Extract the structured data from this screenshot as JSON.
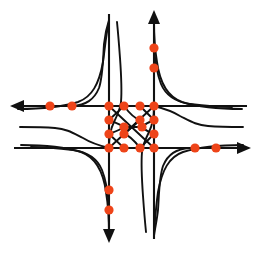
{
  "diagram": {
    "type": "node-link-road-network",
    "canvas": {
      "width": 261,
      "height": 253
    },
    "colors": {
      "background": "#ffffff",
      "road": "#111111",
      "node": "#ee4419",
      "arrow": "#111111"
    },
    "axes": {
      "horizontal_road_upper_y": 106,
      "horizontal_road_lower_y": 148,
      "vertical_road_left_x": 109,
      "vertical_road_right_x": 154
    },
    "arrows": [
      {
        "name": "west-arrow",
        "direction": "west",
        "tip_x": 10,
        "tip_y": 106
      },
      {
        "name": "east-arrow",
        "direction": "east",
        "tip_x": 251,
        "tip_y": 148
      },
      {
        "name": "north-arrow",
        "direction": "north",
        "tip_x": 154,
        "tip_y": 10
      },
      {
        "name": "south-arrow",
        "direction": "south",
        "tip_x": 109,
        "tip_y": 243
      }
    ],
    "nodes": [
      {
        "id": "n01",
        "label": "west-outer-far",
        "x": 50,
        "y": 106,
        "r": 4.6
      },
      {
        "id": "n02",
        "label": "west-outer-near",
        "x": 72,
        "y": 106,
        "r": 4.6
      },
      {
        "id": "n03",
        "label": "grid-r1c1",
        "x": 109,
        "y": 106,
        "r": 4.6
      },
      {
        "id": "n04",
        "label": "grid-r1c2",
        "x": 124,
        "y": 106,
        "r": 4.6
      },
      {
        "id": "n05",
        "label": "grid-r1c3",
        "x": 140,
        "y": 106,
        "r": 4.6
      },
      {
        "id": "n06",
        "label": "grid-r1c4",
        "x": 154,
        "y": 106,
        "r": 4.6
      },
      {
        "id": "n07",
        "label": "grid-r2c1",
        "x": 109,
        "y": 120,
        "r": 4.6
      },
      {
        "id": "n08",
        "label": "grid-r2c3",
        "x": 140,
        "y": 120,
        "r": 4.6
      },
      {
        "id": "n09",
        "label": "grid-r2c4",
        "x": 154,
        "y": 120,
        "r": 4.6
      },
      {
        "id": "n10",
        "label": "grid-mid-left",
        "x": 124,
        "y": 127,
        "r": 4.6
      },
      {
        "id": "n11",
        "label": "grid-mid-right",
        "x": 142,
        "y": 127,
        "r": 4.6
      },
      {
        "id": "n12",
        "label": "grid-r3c1",
        "x": 109,
        "y": 134,
        "r": 4.6
      },
      {
        "id": "n13",
        "label": "grid-r3c2",
        "x": 124,
        "y": 134,
        "r": 4.6
      },
      {
        "id": "n14",
        "label": "grid-r3c4",
        "x": 154,
        "y": 134,
        "r": 4.6
      },
      {
        "id": "n15",
        "label": "grid-r4c1",
        "x": 109,
        "y": 148,
        "r": 4.6
      },
      {
        "id": "n16",
        "label": "grid-r4c2",
        "x": 124,
        "y": 148,
        "r": 4.6
      },
      {
        "id": "n17",
        "label": "grid-r4c3",
        "x": 140,
        "y": 148,
        "r": 4.6
      },
      {
        "id": "n18",
        "label": "grid-r4c4",
        "x": 154,
        "y": 148,
        "r": 4.6
      },
      {
        "id": "n19",
        "label": "east-outer-near",
        "x": 195,
        "y": 148,
        "r": 4.6
      },
      {
        "id": "n20",
        "label": "east-outer-far",
        "x": 216,
        "y": 148,
        "r": 4.6
      },
      {
        "id": "n21",
        "label": "north-outer-near",
        "x": 154,
        "y": 68,
        "r": 4.6
      },
      {
        "id": "n22",
        "label": "north-outer-far",
        "x": 154,
        "y": 48,
        "r": 4.6
      },
      {
        "id": "n23",
        "label": "south-outer-near",
        "x": 109,
        "y": 190,
        "r": 4.6
      },
      {
        "id": "n24",
        "label": "south-outer-far",
        "x": 109,
        "y": 210,
        "r": 4.6
      }
    ],
    "roads": [
      {
        "name": "west-bound-arterial",
        "orientation": "horizontal",
        "y": 106
      },
      {
        "name": "east-bound-arterial",
        "orientation": "horizontal",
        "y": 148
      },
      {
        "name": "south-bound-arterial",
        "orientation": "vertical",
        "x": 109
      },
      {
        "name": "north-bound-arterial",
        "orientation": "vertical",
        "x": 154
      }
    ],
    "ramps": [
      {
        "name": "ramp-nw-outer",
        "quadrant": "northwest"
      },
      {
        "name": "ramp-nw-inner",
        "quadrant": "northwest"
      },
      {
        "name": "ramp-ne-outer",
        "quadrant": "northeast"
      },
      {
        "name": "ramp-ne-inner",
        "quadrant": "northeast"
      },
      {
        "name": "ramp-sw-outer",
        "quadrant": "southwest"
      },
      {
        "name": "ramp-sw-inner",
        "quadrant": "southwest"
      },
      {
        "name": "ramp-se-outer",
        "quadrant": "southeast"
      },
      {
        "name": "ramp-se-inner",
        "quadrant": "southeast"
      },
      {
        "name": "diagonal-nw-se",
        "quadrant": "center"
      },
      {
        "name": "diagonal-ne-sw",
        "quadrant": "center"
      }
    ]
  }
}
